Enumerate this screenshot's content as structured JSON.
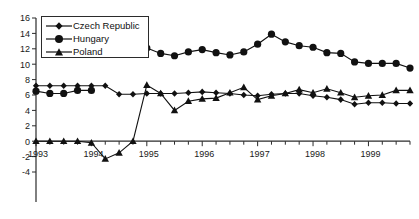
{
  "chart_data": {
    "type": "line",
    "title": "",
    "xlabel": "",
    "ylabel": "",
    "grid": false,
    "legend_position": "top-left",
    "xlim": [
      1993.0,
      1999.75
    ],
    "ylim": [
      -4,
      16
    ],
    "ytick_labels": [
      "16",
      "14",
      "12",
      "10",
      "8",
      "6",
      "4",
      "2",
      "0",
      "-2",
      "-4"
    ],
    "yticks": [
      16,
      14,
      12,
      10,
      8,
      6,
      4,
      2,
      0,
      -2,
      -4
    ],
    "xtick_labels": [
      "1993",
      "1994",
      "1995",
      "1996",
      "1997",
      "1998",
      "1999"
    ],
    "xticks": [
      1993,
      1994,
      1995,
      1996,
      1997,
      1998,
      1999
    ],
    "x": [
      1993.0,
      1993.25,
      1993.5,
      1993.75,
      1994.0,
      1994.25,
      1994.5,
      1994.75,
      1995.0,
      1995.25,
      1995.5,
      1995.75,
      1996.0,
      1996.25,
      1996.5,
      1996.75,
      1997.0,
      1997.25,
      1997.5,
      1997.75,
      1998.0,
      1998.25,
      1998.5,
      1998.75,
      1999.0,
      1999.25,
      1999.5,
      1999.75
    ],
    "series": [
      {
        "name": "Czech Republic",
        "marker": "diamond",
        "values": [
          7.2,
          7.2,
          7.2,
          7.2,
          7.2,
          7.2,
          6.1,
          6.1,
          6.2,
          6.2,
          6.2,
          6.3,
          6.4,
          6.3,
          6.2,
          6.0,
          5.9,
          6.1,
          6.2,
          6.2,
          5.9,
          5.7,
          5.4,
          4.8,
          5.0,
          5.0,
          4.9,
          4.9
        ]
      },
      {
        "name": "Hungary",
        "marker": "circle",
        "values": [
          6.5,
          6.2,
          6.2,
          6.6,
          6.6,
          null,
          null,
          null,
          12.1,
          11.4,
          11.1,
          11.6,
          11.9,
          11.5,
          11.2,
          11.6,
          12.6,
          13.9,
          12.9,
          12.4,
          12.2,
          11.5,
          11.4,
          10.3,
          10.1,
          10.1,
          10.1,
          9.5
        ]
      },
      {
        "name": "Poland",
        "marker": "triangle",
        "values": [
          0.0,
          0.0,
          0.0,
          0.0,
          -0.2,
          -2.3,
          -1.5,
          0.0,
          7.3,
          6.2,
          4.0,
          5.2,
          5.5,
          5.6,
          6.3,
          7.0,
          5.4,
          5.9,
          6.2,
          6.7,
          6.3,
          6.8,
          6.3,
          5.7,
          5.9,
          6.0,
          6.6,
          6.6
        ]
      }
    ]
  },
  "legend": {
    "entries": [
      {
        "label": "Czech Republic",
        "marker": "diamond"
      },
      {
        "label": "Hungary",
        "marker": "circle"
      },
      {
        "label": "Poland",
        "marker": "triangle"
      }
    ]
  }
}
